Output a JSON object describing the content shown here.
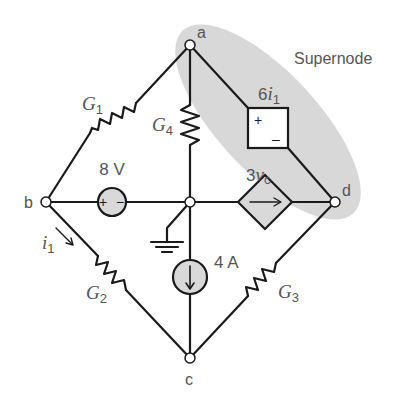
{
  "diagram": {
    "type": "electrical circuit schematic",
    "supernode_label": "Supernode",
    "colors": {
      "wire": "#1a1a1a",
      "label": "#555555",
      "source_fill": "#d9d9d9",
      "supernode_fill": "#d4d4d4"
    },
    "nodes": {
      "a": "a",
      "b": "b",
      "c": "c",
      "d": "d"
    },
    "resistors": {
      "g1": {
        "symbol": "G",
        "subscript": "1"
      },
      "g2": {
        "symbol": "G",
        "subscript": "2"
      },
      "g3": {
        "symbol": "G",
        "subscript": "3"
      },
      "g4": {
        "symbol": "G",
        "subscript": "4"
      }
    },
    "voltage_source": {
      "value": "8 V",
      "plus": "+",
      "minus": "−"
    },
    "current_source": {
      "value": "4 A"
    },
    "dependent_voltage_source": {
      "coefficient": "6",
      "variable": "i",
      "subscript": "1",
      "plus": "+",
      "minus": "–"
    },
    "dependent_current_source": {
      "coefficient": "3",
      "variable": "v",
      "subscript": "c"
    },
    "current_label": {
      "variable": "i",
      "subscript": "1"
    },
    "ground": "ground"
  }
}
